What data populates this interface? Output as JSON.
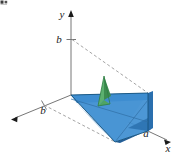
{
  "figure": {
    "background_color": "#ffffff",
    "axes": {
      "x_label": "x",
      "y_label": "y",
      "z_label": "",
      "axis_color": "#777777"
    },
    "labels": {
      "y_axis_tick": "b",
      "z_axis_tick": "b",
      "x_axis_tick": "a",
      "x_axis_name": "x",
      "y_axis_name": "y"
    },
    "colors": {
      "top_face": "#3d8fd0",
      "front_face": "#2f7cbd",
      "side_face": "#4c9bd8",
      "bottom_face": "#b9d3ea",
      "cross_section": "#4fa463",
      "cross_section_dark": "#3c8a50",
      "edge_dark": "#16537e",
      "dashed_gray": "#9a9a9a",
      "axis_gray": "#777777",
      "text": "#1a1a1a"
    },
    "corner_artifact": {
      "present": true,
      "description": "small dark crop artifact top-left"
    }
  }
}
